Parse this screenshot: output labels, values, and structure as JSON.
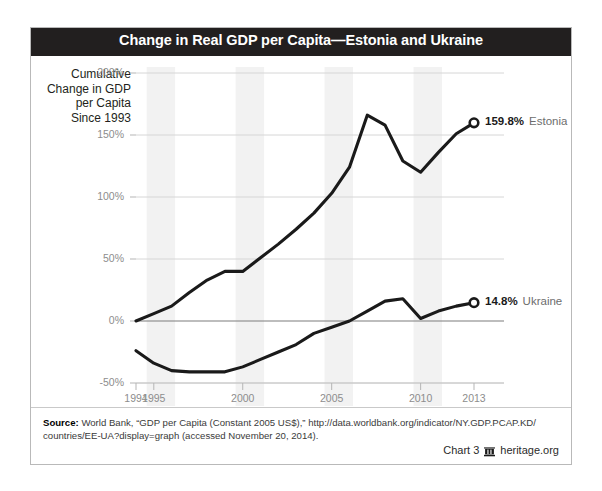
{
  "card": {
    "title": "Change in Real GDP per Capita—Estonia and Ukraine"
  },
  "source": {
    "label": "Source:",
    "text": " World Bank, “GDP per Capita (Constant 2005 US$),” http://data.worldbank.org/indicator/NY.GDP.PCAP.KD/ countries/EE-UA?display=graph (accessed November 20, 2014)."
  },
  "footer": {
    "chart_number": "Chart 3",
    "site": "heritage.org",
    "glyph_name": "heritage-building-icon"
  },
  "chart_data": {
    "type": "line",
    "title": "Change in Real GDP per Capita—Estonia and Ukraine",
    "xlabel": "",
    "ylabel": "Cumulative Change in GDP per Capita Since 1993",
    "ylim": [
      -50,
      200
    ],
    "xlim": [
      1994,
      2013
    ],
    "ytick_labels": [
      "200%",
      "150%",
      "100%",
      "50%",
      "0%",
      "-50%"
    ],
    "ytick_values": [
      200,
      150,
      100,
      50,
      0,
      -50
    ],
    "xtick_labels": [
      "1994",
      "1995",
      "2000",
      "2005",
      "2010",
      "2013"
    ],
    "xtick_values": [
      1994,
      1995,
      2000,
      2005,
      2010,
      2013
    ],
    "grid": "horizontal",
    "legend": "right-endpoint-labels",
    "x": [
      1994,
      1995,
      1996,
      1997,
      1998,
      1999,
      2000,
      2001,
      2002,
      2003,
      2004,
      2005,
      2006,
      2007,
      2008,
      2009,
      2010,
      2011,
      2012,
      2013
    ],
    "series": [
      {
        "name": "Estonia",
        "end_label": "159.8%",
        "color": "#1a1a1a",
        "values": [
          0,
          6,
          12,
          23,
          33,
          40,
          40,
          51,
          62,
          74,
          87,
          103,
          124,
          166,
          158,
          129,
          120,
          136,
          151,
          159.8
        ]
      },
      {
        "name": "Ukraine",
        "end_label": "14.8%",
        "color": "#1a1a1a",
        "values": [
          -24,
          -34,
          -40,
          -41,
          -41,
          -41,
          -37,
          -31,
          -25,
          -19,
          -10,
          -5,
          0,
          8,
          16,
          18,
          2,
          8,
          12,
          14.8
        ]
      }
    ]
  }
}
